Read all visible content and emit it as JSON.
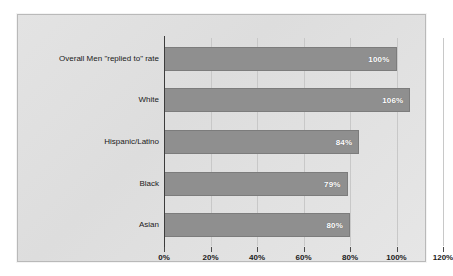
{
  "chart_data": {
    "type": "bar",
    "orientation": "horizontal",
    "title": "",
    "subtitle": "",
    "xlabel": "",
    "ylabel": "",
    "categories": [
      "Overall Men \"replied to\" rate",
      "White",
      "Hispanic/Latino",
      "Black",
      "Asian"
    ],
    "values": [
      100,
      106,
      84,
      79,
      80
    ],
    "value_labels": [
      "100%",
      "106%",
      "84%",
      "79%",
      "80%"
    ],
    "xlim": [
      0,
      120
    ],
    "xticks": [
      0,
      20,
      40,
      60,
      80,
      100,
      120
    ],
    "xtick_labels": [
      "0%",
      "20%",
      "40%",
      "60%",
      "80%",
      "100%",
      "120%"
    ],
    "grid": true,
    "grid_axis": "x",
    "legend": false,
    "legend_position": "none",
    "bar_color": "#8f8f8f",
    "bar_edge_color": "#7c7c7c",
    "value_label_color": "#ffffff",
    "panel_color": "#e1e1e1",
    "panel_border_color": "#b9b9b9",
    "axis_color": "#3c3c3c",
    "gridline_color": "#c8c8c8",
    "text_color": "#1a1a1a"
  }
}
